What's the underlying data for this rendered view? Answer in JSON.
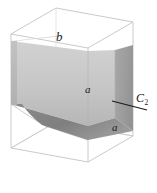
{
  "figure": {
    "background_color": "#ffffff",
    "labels": {
      "edge_b": "b",
      "edge_a_upper": "a",
      "edge_a_lower": "a",
      "plane_symbol": "C",
      "plane_subscript": "2"
    },
    "colors": {
      "box_outline": "#cfcfcf",
      "panel_front_light": "#c9c9c9",
      "panel_front_mid": "#bdbdbd",
      "panel_right_dark": "#a0a0a0",
      "panel_underside": "#8d8d8d",
      "panel_top_face": "#d8d8d8",
      "leader_line": "#1a1a1a",
      "label_text": "#1a1a1a"
    },
    "geometry": {
      "box_vertices": {
        "top_back": [
          56,
          8
        ],
        "top_left": [
          11,
          34
        ],
        "top_right": [
          133,
          22
        ],
        "top_front": [
          88,
          48
        ],
        "bottom_left": [
          11,
          148
        ],
        "bottom_back": [
          56,
          122
        ],
        "bottom_right": [
          133,
          136
        ],
        "bottom_front": [
          88,
          162
        ]
      },
      "leader_line_from": [
        112,
        101
      ],
      "leader_line_to": [
        147,
        110
      ]
    }
  }
}
